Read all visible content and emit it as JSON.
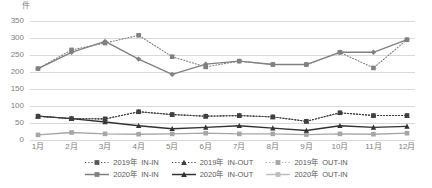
{
  "chart_data": {
    "type": "line",
    "title": "",
    "subtitle": "",
    "unit_label": "件",
    "xlabel": "",
    "ylabel": "件",
    "ylim": [
      0,
      350
    ],
    "ytick_step": 50,
    "grid": true,
    "legend_position": "bottom",
    "categories": [
      "1月",
      "2月",
      "3月",
      "4月",
      "5月",
      "6月",
      "7月",
      "8月",
      "9月",
      "10月",
      "11月",
      "12月"
    ],
    "ticks": {
      "y": [
        "0",
        "50",
        "100",
        "150",
        "200",
        "250",
        "300",
        "350"
      ],
      "x": [
        "1月",
        "2月",
        "3月",
        "4月",
        "5月",
        "6月",
        "7月",
        "8月",
        "9月",
        "10月",
        "11月",
        "12月"
      ]
    },
    "series": [
      {
        "name": "2019年　IN-IN",
        "year": "2019年",
        "flow": "IN-IN",
        "style": "dotted",
        "marker": "square",
        "color": "#404040",
        "values": [
          70,
          63,
          62,
          83,
          75,
          70,
          72,
          68,
          55,
          80,
          72,
          72
        ]
      },
      {
        "name": "2019年　IN-OUT",
        "year": "2019年",
        "flow": "IN-OUT",
        "style": "dotted",
        "marker": "triangle",
        "color": "#404040",
        "values": [
          70,
          63,
          62,
          83,
          75,
          70,
          72,
          68,
          55,
          80,
          72,
          72
        ]
      },
      {
        "name": "2019年　OUT-IN",
        "year": "2019年",
        "flow": "OUT-IN",
        "style": "dotted",
        "marker": "square",
        "color": "#808080",
        "values": [
          210,
          265,
          285,
          308,
          245,
          215,
          232,
          222,
          222,
          258,
          212,
          295
        ]
      },
      {
        "name": "2020年　IN-IN",
        "year": "2020年",
        "flow": "IN-IN",
        "style": "solid",
        "marker": "square",
        "color": "#a6a6a6",
        "values": [
          15,
          22,
          18,
          17,
          18,
          20,
          18,
          18,
          16,
          18,
          17,
          20
        ]
      },
      {
        "name": "2020年　IN-OUT",
        "year": "2020年",
        "flow": "IN-OUT",
        "style": "solid",
        "marker": "triangle",
        "color": "#333333",
        "values": [
          70,
          63,
          53,
          42,
          33,
          37,
          42,
          35,
          28,
          42,
          37,
          40
        ]
      },
      {
        "name": "2020年　OUT-IN",
        "year": "2020年",
        "flow": "OUT-IN",
        "style": "solid",
        "marker": "diamond",
        "color": "#808080",
        "values": [
          210,
          258,
          290,
          238,
          193,
          223,
          232,
          222,
          222,
          258,
          258,
          295
        ]
      }
    ],
    "legend": [
      {
        "year": "2019年",
        "flow": "IN-IN",
        "style": "dotted",
        "marker": "square",
        "color": "#595959"
      },
      {
        "year": "2019年",
        "flow": "IN-OUT",
        "style": "dotted",
        "marker": "triangle",
        "color": "#404040"
      },
      {
        "year": "2019年",
        "flow": "OUT-IN",
        "style": "dotted",
        "marker": "square",
        "color": "#a6a6a6"
      },
      {
        "year": "2020年",
        "flow": "IN-IN",
        "style": "solid",
        "marker": "square",
        "color": "#808080"
      },
      {
        "year": "2020年",
        "flow": "IN-OUT",
        "style": "solid",
        "marker": "triangle",
        "color": "#333333"
      },
      {
        "year": "2020年",
        "flow": "OUT-IN",
        "style": "solid",
        "marker": "square",
        "color": "#bfbfbf"
      }
    ],
    "colors": {
      "grid": "#d9d9d9",
      "axis_text": "#808080",
      "legend_text": "#595959",
      "background": "#ffffff",
      "dark": "#333333",
      "mid": "#808080",
      "light": "#bfbfbf"
    }
  }
}
